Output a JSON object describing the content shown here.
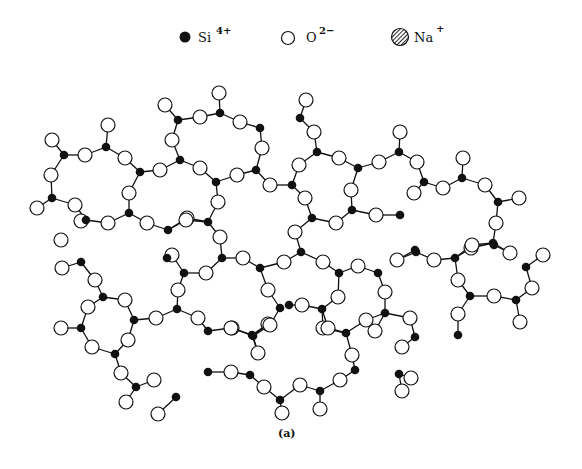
{
  "legend": {
    "items": [
      {
        "symbol": "filled-circle",
        "label": "Si",
        "charge": "4+",
        "x": 190,
        "y": 40
      },
      {
        "symbol": "open-circle",
        "label": "O",
        "charge": "2−",
        "x": 291,
        "y": 40
      },
      {
        "symbol": "hatched-circle",
        "label": "Na",
        "charge": "+",
        "x": 390,
        "y": 40
      }
    ]
  },
  "caption": "(a)",
  "colors": {
    "si": "#111111",
    "o_fill": "#ffffff",
    "stroke": "#111111"
  },
  "network": {
    "si": [
      [
        64,
        155
      ],
      [
        106,
        147
      ],
      [
        140,
        172
      ],
      [
        52,
        198
      ],
      [
        129,
        213
      ],
      [
        86,
        220
      ],
      [
        178,
        120
      ],
      [
        220,
        113
      ],
      [
        260,
        128
      ],
      [
        180,
        160
      ],
      [
        256,
        170
      ],
      [
        216,
        182
      ],
      [
        292,
        185
      ],
      [
        300,
        118
      ],
      [
        317,
        152
      ],
      [
        358,
        168
      ],
      [
        399,
        152
      ],
      [
        424,
        182
      ],
      [
        352,
        210
      ],
      [
        312,
        218
      ],
      [
        400,
        215
      ],
      [
        462,
        178
      ],
      [
        498,
        202
      ],
      [
        494,
        245
      ],
      [
        455,
        258
      ],
      [
        416,
        252
      ],
      [
        493,
        243
      ],
      [
        526,
        267
      ],
      [
        470,
        296
      ],
      [
        516,
        300
      ],
      [
        458,
        335
      ],
      [
        415,
        337
      ],
      [
        81,
        262
      ],
      [
        103,
        297
      ],
      [
        134,
        320
      ],
      [
        81,
        328
      ],
      [
        167,
        258
      ],
      [
        168,
        230
      ],
      [
        208,
        222
      ],
      [
        222,
        258
      ],
      [
        184,
        273
      ],
      [
        260,
        268
      ],
      [
        177,
        309
      ],
      [
        208,
        331
      ],
      [
        253,
        336
      ],
      [
        289,
        305
      ],
      [
        115,
        354
      ],
      [
        136,
        387
      ],
      [
        176,
        397
      ],
      [
        208,
        372
      ],
      [
        252,
        335
      ],
      [
        250,
        375
      ],
      [
        280,
        400
      ],
      [
        320,
        391
      ],
      [
        355,
        370
      ],
      [
        399,
        374
      ],
      [
        346,
        333
      ],
      [
        301,
        252
      ],
      [
        339,
        273
      ],
      [
        378,
        273
      ],
      [
        415,
        250
      ],
      [
        280,
        308
      ],
      [
        322,
        309
      ],
      [
        385,
        313
      ]
    ],
    "o": [
      [
        52,
        140
      ],
      [
        51,
        175
      ],
      [
        85,
        155
      ],
      [
        108,
        125
      ],
      [
        125,
        158
      ],
      [
        129,
        193
      ],
      [
        37,
        208
      ],
      [
        75,
        205
      ],
      [
        165,
        105
      ],
      [
        219,
        93
      ],
      [
        200,
        117
      ],
      [
        240,
        122
      ],
      [
        172,
        140
      ],
      [
        262,
        148
      ],
      [
        160,
        170
      ],
      [
        200,
        168
      ],
      [
        237,
        175
      ],
      [
        270,
        185
      ],
      [
        218,
        202
      ],
      [
        187,
        218
      ],
      [
        306,
        100
      ],
      [
        314,
        132
      ],
      [
        299,
        165
      ],
      [
        339,
        158
      ],
      [
        379,
        162
      ],
      [
        400,
        132
      ],
      [
        417,
        162
      ],
      [
        351,
        190
      ],
      [
        305,
        198
      ],
      [
        336,
        223
      ],
      [
        376,
        215
      ],
      [
        414,
        193
      ],
      [
        295,
        232
      ],
      [
        463,
        158
      ],
      [
        443,
        188
      ],
      [
        485,
        185
      ],
      [
        519,
        198
      ],
      [
        496,
        223
      ],
      [
        471,
        248
      ],
      [
        510,
        253
      ],
      [
        543,
        255
      ],
      [
        434,
        260
      ],
      [
        472,
        245
      ],
      [
        458,
        280
      ],
      [
        494,
        296
      ],
      [
        532,
        288
      ],
      [
        458,
        314
      ],
      [
        520,
        322
      ],
      [
        410,
        318
      ],
      [
        81,
        221
      ],
      [
        108,
        223
      ],
      [
        147,
        223
      ],
      [
        61,
        240
      ],
      [
        62,
        268
      ],
      [
        95,
        280
      ],
      [
        125,
        300
      ],
      [
        88,
        307
      ],
      [
        61,
        328
      ],
      [
        186,
        220
      ],
      [
        220,
        237
      ],
      [
        172,
        255
      ],
      [
        206,
        273
      ],
      [
        243,
        258
      ],
      [
        284,
        262
      ],
      [
        178,
        290
      ],
      [
        268,
        290
      ],
      [
        198,
        318
      ],
      [
        232,
        328
      ],
      [
        268,
        324
      ],
      [
        156,
        318
      ],
      [
        92,
        347
      ],
      [
        128,
        340
      ],
      [
        121,
        373
      ],
      [
        154,
        380
      ],
      [
        126,
        402
      ],
      [
        158,
        414
      ],
      [
        231,
        328
      ],
      [
        270,
        325
      ],
      [
        258,
        353
      ],
      [
        231,
        372
      ],
      [
        264,
        387
      ],
      [
        300,
        385
      ],
      [
        340,
        380
      ],
      [
        352,
        355
      ],
      [
        323,
        328
      ],
      [
        375,
        331
      ],
      [
        402,
        347
      ],
      [
        411,
        378
      ],
      [
        402,
        391
      ],
      [
        282,
        413
      ],
      [
        320,
        409
      ],
      [
        323,
        262
      ],
      [
        358,
        266
      ],
      [
        397,
        260
      ],
      [
        302,
        305
      ],
      [
        338,
        297
      ],
      [
        385,
        292
      ],
      [
        328,
        328
      ],
      [
        366,
        320
      ]
    ]
  }
}
